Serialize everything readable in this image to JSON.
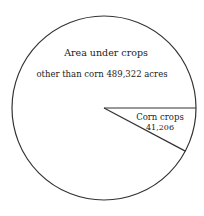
{
  "chart_data": {
    "type": "pie",
    "title": "",
    "slices": [
      {
        "label": "Area under crops other than corn",
        "value": 489322,
        "unit": "acres"
      },
      {
        "label": "Corn crops",
        "value": 41206,
        "unit": "acres"
      }
    ],
    "categories": [
      "Area under crops other than corn",
      "Corn crops"
    ],
    "values": [
      489322,
      41206
    ],
    "legend": "none",
    "annotations": [
      "Area under crops",
      "other than corn  489,322 acres",
      "Corn crops",
      "41,206"
    ]
  },
  "labels": {
    "other_line1": "Area under crops",
    "other_line2": "other than corn  489,322 acres",
    "corn_line1": "Corn crops",
    "corn_line2": "41,206"
  },
  "colors": {
    "stroke": "#333333",
    "fill": "#ffffff"
  }
}
